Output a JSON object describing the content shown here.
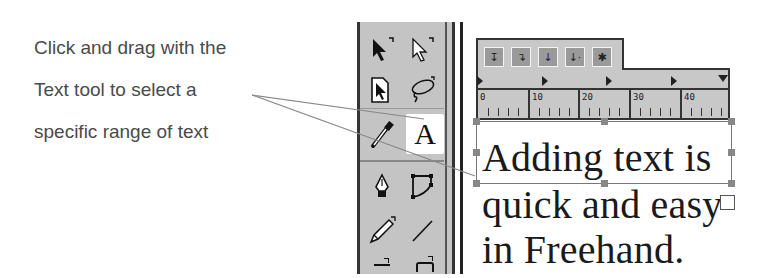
{
  "caption": {
    "lines": [
      "Click and drag with the",
      "Text tool to select a",
      "specific range of text"
    ]
  },
  "toolbox": {
    "tools": [
      {
        "name": "pointer-tool",
        "row": 0,
        "col": 0
      },
      {
        "name": "subselect-tool",
        "row": 0,
        "col": 1
      },
      {
        "name": "page-tool",
        "row": 1,
        "col": 0
      },
      {
        "name": "lasso-tool",
        "row": 1,
        "col": 1
      },
      {
        "name": "eyedropper-tool",
        "row": 2,
        "col": 0
      },
      {
        "name": "text-tool",
        "row": 2,
        "col": 1,
        "label": "A",
        "active": true
      },
      {
        "name": "pen-tool",
        "row": 3,
        "col": 0
      },
      {
        "name": "bezigon-tool",
        "row": 3,
        "col": 1
      },
      {
        "name": "pencil-tool",
        "row": 4,
        "col": 0
      },
      {
        "name": "line-tool",
        "row": 4,
        "col": 1
      }
    ]
  },
  "text_ruler": {
    "tab_buttons": [
      "left-tab",
      "right-tab",
      "center-tab",
      "decimal-tab",
      "wrapping-tab"
    ],
    "ruler_labels": [
      "0",
      "10",
      "20",
      "30",
      "40"
    ]
  },
  "text_block": {
    "lines": [
      "Adding text is",
      "quick and easy",
      "in Freehand."
    ]
  },
  "colors": {
    "toolbox_bg": "#c4c4c4",
    "ruler_bg": "#c8c8c8",
    "border_dark": "#333333",
    "caption_text": "#4a4a4a",
    "callout_line": "#8a8a8a"
  }
}
